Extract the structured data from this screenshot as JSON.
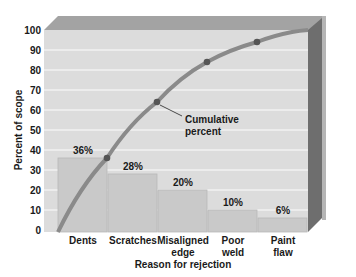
{
  "chart_data": {
    "type": "bar",
    "title": "",
    "xlabel": "Reason for rejection",
    "ylabel": "Percent of scope",
    "ylim": [
      0,
      100
    ],
    "yticks": [
      0,
      10,
      20,
      30,
      40,
      50,
      60,
      70,
      80,
      90,
      100
    ],
    "grid": true,
    "categories": [
      "Dents",
      "Scratches",
      "Misaligned edge",
      "Poor weld",
      "Paint flaw"
    ],
    "category_lines": [
      [
        "Dents"
      ],
      [
        "Scratches"
      ],
      [
        "Misaligned",
        "edge"
      ],
      [
        "Poor",
        "weld"
      ],
      [
        "Paint",
        "flaw"
      ]
    ],
    "series": [
      {
        "name": "Percent",
        "type": "bar",
        "values": [
          36,
          28,
          20,
          10,
          6
        ],
        "labels": [
          "36%",
          "28%",
          "20%",
          "10%",
          "6%"
        ]
      },
      {
        "name": "Cumulative percent",
        "type": "line",
        "values": [
          36,
          64,
          84,
          94,
          100
        ]
      }
    ],
    "annotations": [
      {
        "text_lines": [
          "Cumulative",
          "percent"
        ],
        "points_to": "Scratches cumulative point (64)"
      }
    ],
    "legend": "none",
    "colors": {
      "plot_bg": "#dcdcdc",
      "bar_fill": "#c9c9c9",
      "bar_edge": "#b8b8b8",
      "gridline": "#f2f2f2",
      "curve": "#8a8a8a",
      "marker": "#555555",
      "frame_top": "#9a9a9a",
      "frame_side": "#6e6e6e"
    }
  }
}
